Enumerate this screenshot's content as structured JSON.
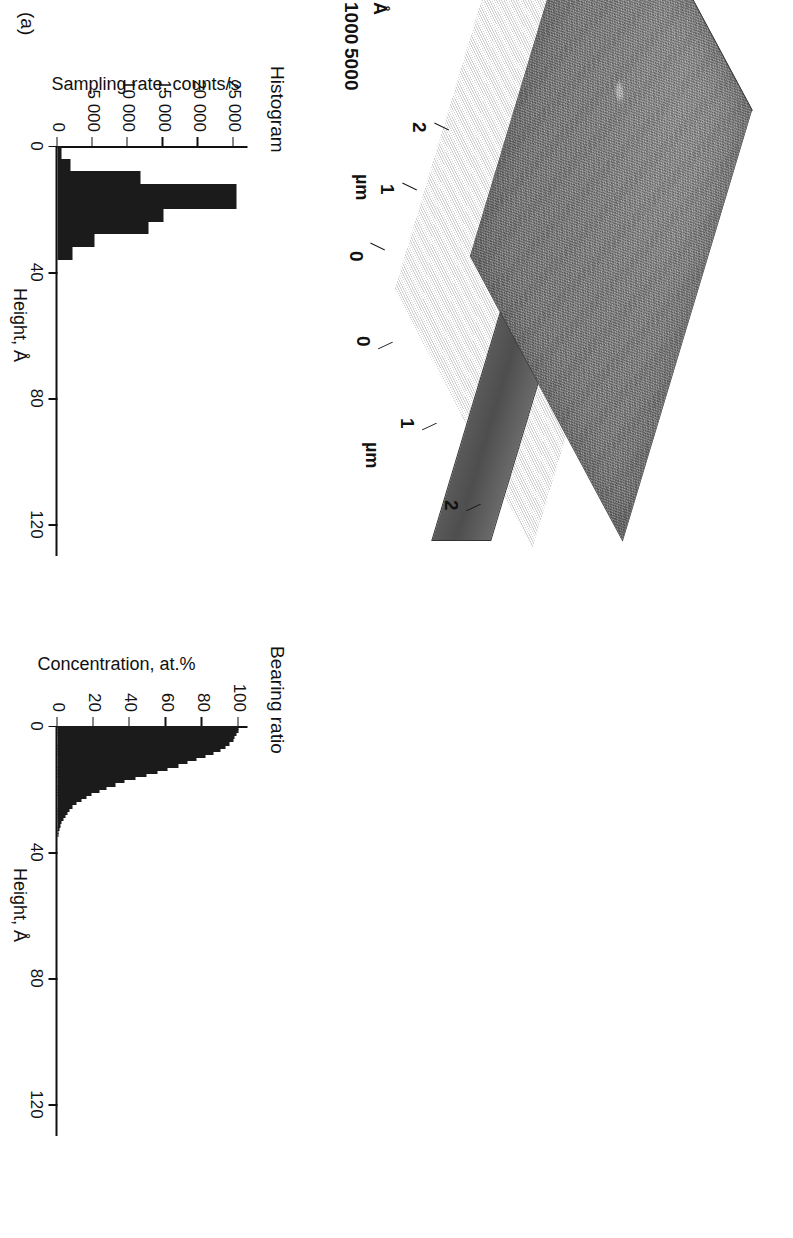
{
  "figure": {
    "panel_label": "(a)"
  },
  "afm": {
    "name": "afm-3d-surface",
    "x_axis": {
      "unit": "µm",
      "ticks": [
        "0",
        "1",
        "2"
      ]
    },
    "y_axis": {
      "unit": "µm",
      "ticks": [
        "0",
        "1",
        "2"
      ]
    },
    "z_axis": {
      "unit": "Å",
      "ticks": [
        "0",
        "500",
        "1000"
      ]
    }
  },
  "chart_data": [
    {
      "id": "histogram",
      "type": "bar",
      "title": "Histogram",
      "xlabel": "Height, Å",
      "ylabel": "Sampling rate, counts/s",
      "xlim": [
        0,
        130
      ],
      "ylim": [
        0,
        27000
      ],
      "xticks": [
        0,
        40,
        80,
        120
      ],
      "xtick_labels": [
        "0",
        "40",
        "80",
        "120"
      ],
      "yticks": [
        0,
        5000,
        10000,
        15000,
        20000,
        25000
      ],
      "ytick_labels": [
        "0",
        "5 000",
        "10 000",
        "15 000",
        "20 000",
        "25 000"
      ],
      "grid": false,
      "bin_width": 4,
      "bin_starts": [
        0,
        4,
        8,
        12,
        16,
        20,
        24,
        28,
        32
      ],
      "values": [
        600,
        1900,
        11800,
        25500,
        25500,
        15000,
        13000,
        5200,
        2200
      ]
    },
    {
      "id": "bearing-ratio",
      "type": "area",
      "title": "Bearing ratio",
      "xlabel": "Height, Å",
      "ylabel": "Concentration, at.%",
      "xlim": [
        0,
        130
      ],
      "ylim": [
        0,
        105
      ],
      "xticks": [
        0,
        40,
        80,
        120
      ],
      "xtick_labels": [
        "0",
        "40",
        "80",
        "120"
      ],
      "yticks": [
        0,
        20,
        40,
        60,
        80,
        100
      ],
      "ytick_labels": [
        "0",
        "20",
        "40",
        "60",
        "80",
        "100"
      ],
      "grid": false,
      "x": [
        0,
        1,
        2,
        3,
        4,
        5,
        6,
        7,
        8,
        9,
        10,
        11,
        12,
        13,
        14,
        15,
        16,
        17,
        18,
        19,
        20,
        21,
        22,
        23,
        24,
        25,
        26,
        27,
        28,
        29,
        30,
        31,
        32,
        33,
        34,
        35
      ],
      "y": [
        100,
        100,
        99,
        98,
        97,
        95,
        93,
        90,
        86,
        82,
        77,
        72,
        67,
        61,
        55,
        49,
        43,
        37,
        32,
        27,
        23,
        19,
        16,
        13,
        10.5,
        8.5,
        6.8,
        5.4,
        4.2,
        3.2,
        2.4,
        1.7,
        1.1,
        0.7,
        0.3,
        0
      ]
    }
  ],
  "colors": {
    "ink": "#111111",
    "bar_fill": "#1b1b1b",
    "surface_light": "#9e9e9e",
    "surface_dark": "#4e4e4e",
    "background": "#ffffff"
  }
}
